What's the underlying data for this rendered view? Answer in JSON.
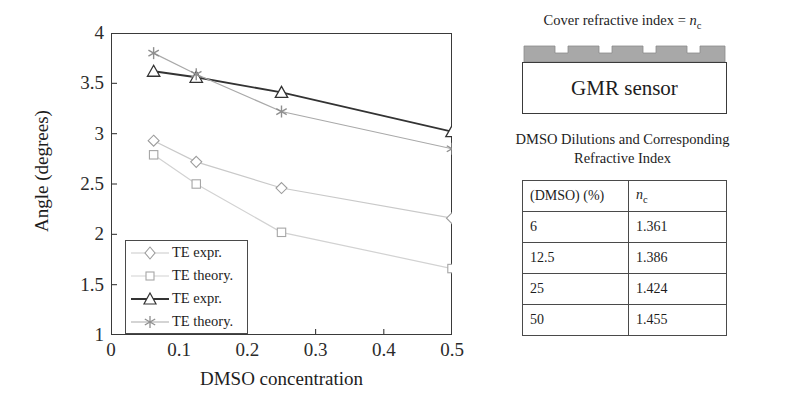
{
  "chart_data": {
    "type": "line",
    "title": "",
    "xlabel": "DMSO concentration",
    "ylabel": "Angle (degrees)",
    "xlim": [
      0,
      0.5
    ],
    "ylim": [
      1,
      4
    ],
    "xticks": [
      "0",
      "0.1",
      "0.2",
      "0.3",
      "0.4",
      "0.5"
    ],
    "xtick_values": [
      0,
      0.1,
      0.2,
      0.3,
      0.4,
      0.5
    ],
    "yticks": [
      "1",
      "1.5",
      "2",
      "2.5",
      "3",
      "3.5",
      "4"
    ],
    "ytick_values": [
      1,
      1.5,
      2,
      2.5,
      3,
      3.5,
      4
    ],
    "grid": false,
    "legend_position": "lower-left-inside",
    "x": [
      0.0625,
      0.125,
      0.25,
      0.5
    ],
    "series": [
      {
        "name": "TE expr.",
        "marker": "diamond",
        "color": "#c9c9c9",
        "values": [
          2.93,
          2.72,
          2.46,
          2.16
        ]
      },
      {
        "name": "TE theory.",
        "marker": "square",
        "color": "#d2d2d2",
        "values": [
          2.79,
          2.5,
          2.02,
          1.66
        ]
      },
      {
        "name": "TE expr.",
        "marker": "triangle",
        "color": "#333333",
        "values": [
          3.62,
          3.56,
          3.41,
          3.02
        ]
      },
      {
        "name": "TE theory.",
        "marker": "asterisk",
        "color": "#a9a9a9",
        "values": [
          3.8,
          3.59,
          3.22,
          2.85
        ]
      }
    ]
  },
  "legend": {
    "entries": [
      {
        "label": "TE expr.",
        "marker": "diamond-icon"
      },
      {
        "label": "TE theory.",
        "marker": "square-icon"
      },
      {
        "label": "TE expr.",
        "marker": "triangle-icon"
      },
      {
        "label": "TE theory.",
        "marker": "asterisk-icon"
      }
    ]
  },
  "diagram": {
    "caption_prefix": "Cover refractive index = ",
    "caption_symbol": "n",
    "caption_subscript": "c",
    "sensor_label": "GMR sensor",
    "grating_color": "#a8a8a8"
  },
  "table": {
    "caption_line1": "DMSO Dilutions and Corresponding",
    "caption_line2": "Refractive Index",
    "headers": [
      "(DMSO) (%)",
      "n"
    ],
    "header_subscript": "c",
    "rows": [
      {
        "dmso": "6",
        "nc": "1.361"
      },
      {
        "dmso": "12.5",
        "nc": "1.386"
      },
      {
        "dmso": "25",
        "nc": "1.424"
      },
      {
        "dmso": "50",
        "nc": "1.455"
      }
    ]
  }
}
